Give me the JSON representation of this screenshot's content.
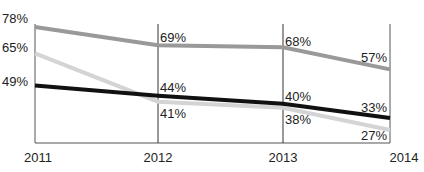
{
  "chart_data": {
    "type": "line",
    "title": "",
    "xlabel": "",
    "ylabel": "",
    "categories": [
      "2011",
      "2012",
      "2013",
      "2014"
    ],
    "series": [
      {
        "name": "Series A (medium gray)",
        "color": "#999999",
        "values": [
          78,
          69,
          68,
          57
        ],
        "labels": [
          "78%",
          "69%",
          "68%",
          "57%"
        ]
      },
      {
        "name": "Series B (light gray)",
        "color": "#d4d4d4",
        "values": [
          65,
          41,
          38,
          27
        ],
        "labels": [
          "65%",
          "41%",
          "38%",
          "27%"
        ]
      },
      {
        "name": "Series C (black)",
        "color": "#111111",
        "values": [
          49,
          44,
          40,
          33
        ],
        "labels": [
          "49%",
          "44%",
          "40%",
          "33%"
        ]
      }
    ],
    "grid": "vertical lines at each year",
    "legend": "none"
  }
}
